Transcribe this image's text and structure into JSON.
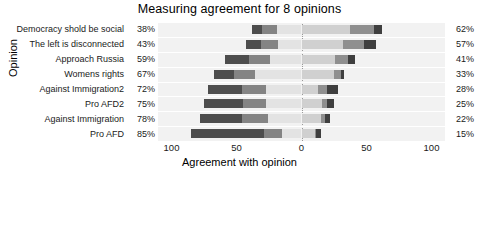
{
  "chart_data": {
    "type": "bar",
    "subtype": "diverging-stacked-likert",
    "title": "Measuring agreement for 8 opinions",
    "xlabel": "Agreement with opinion",
    "ylabel": "Opinion",
    "xlim": [
      -100,
      100
    ],
    "xticks": [
      -100,
      -50,
      0,
      50,
      100
    ],
    "xticklabels": [
      "100",
      "50",
      "0",
      "50",
      "100"
    ],
    "grid": true,
    "legend_title": "Response",
    "legend_position": "bottom",
    "legend_columns": 3,
    "categories": [
      "Democracy shold be social",
      "The left is disconnected",
      "Approach Russia",
      "Womens rights",
      "Against Immigration2",
      "Pro AFD2",
      "Against Immigration",
      "Pro AFD"
    ],
    "left_totals": [
      "38%",
      "43%",
      "59%",
      "67%",
      "72%",
      "75%",
      "78%",
      "85%"
    ],
    "right_totals": [
      "62%",
      "57%",
      "41%",
      "33%",
      "28%",
      "25%",
      "22%",
      "15%"
    ],
    "series": [
      {
        "name": "strongly disagree",
        "color": "#4d4d4d",
        "side": "left",
        "values": [
          8,
          12,
          19,
          15,
          26,
          30,
          32,
          56
        ]
      },
      {
        "name": "disagree",
        "color": "#848484",
        "side": "left",
        "values": [
          11,
          13,
          16,
          16,
          19,
          18,
          20,
          14
        ]
      },
      {
        "name": "rather disagree",
        "color": "#e3e3e3",
        "side": "left",
        "values": [
          19,
          18,
          24,
          36,
          27,
          27,
          26,
          15
        ]
      },
      {
        "name": "rather agree",
        "color": "#d0d0d0",
        "side": "right",
        "values": [
          37,
          32,
          26,
          25,
          13,
          16,
          15,
          10
        ]
      },
      {
        "name": "agree",
        "color": "#8f8f8f",
        "side": "right",
        "values": [
          19,
          16,
          10,
          5,
          7,
          4,
          3,
          1
        ]
      },
      {
        "name": "strongly agree",
        "color": "#3f3f3f",
        "side": "right",
        "values": [
          6,
          9,
          5,
          3,
          8,
          5,
          4,
          4
        ]
      }
    ]
  },
  "legend": {
    "title": "Response",
    "items": [
      {
        "label": "strongly disagree",
        "color": "#4d4d4d"
      },
      {
        "label": "disagree",
        "color": "#848484"
      },
      {
        "label": "rather disagree",
        "color": "#e9e9e9"
      },
      {
        "label": "rather agree",
        "color": "#d4d4d4"
      },
      {
        "label": "agree",
        "color": "#8f8f8f"
      },
      {
        "label": "strongly agree",
        "color": "#3f3f3f"
      }
    ]
  },
  "colors": {
    "panel_background": "#f2f2f2",
    "grid_line": "#ffffff",
    "zero_line": "#9a9a9a",
    "text": "#1a1a1a"
  }
}
